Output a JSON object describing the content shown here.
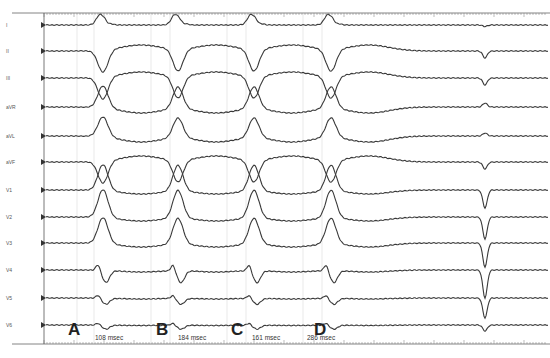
{
  "leads": [
    {
      "name": "I",
      "y": 25
    },
    {
      "name": "II",
      "y": 51
    },
    {
      "name": "III",
      "y": 78
    },
    {
      "name": "aVR",
      "y": 107
    },
    {
      "name": "aVL",
      "y": 136
    },
    {
      "name": "aVF",
      "y": 162
    },
    {
      "name": "V1",
      "y": 190
    },
    {
      "name": "V2",
      "y": 217
    },
    {
      "name": "V3",
      "y": 243
    },
    {
      "name": "V4",
      "y": 270
    },
    {
      "name": "V5",
      "y": 298
    },
    {
      "name": "V6",
      "y": 325
    }
  ],
  "markers": [
    {
      "label": "A",
      "x": 68
    },
    {
      "label": "B",
      "x": 156
    },
    {
      "label": "C",
      "x": 231
    },
    {
      "label": "D",
      "x": 314
    }
  ],
  "intervals": [
    {
      "text": "108 msec",
      "x": 95
    },
    {
      "text": "184 msec",
      "x": 178
    },
    {
      "text": "161 msec",
      "x": 252
    },
    {
      "text": "286 msec",
      "x": 307
    }
  ],
  "colors": {
    "trace": "#3a3a3a",
    "grid": "#e3e3e3",
    "axis": "#555555"
  }
}
